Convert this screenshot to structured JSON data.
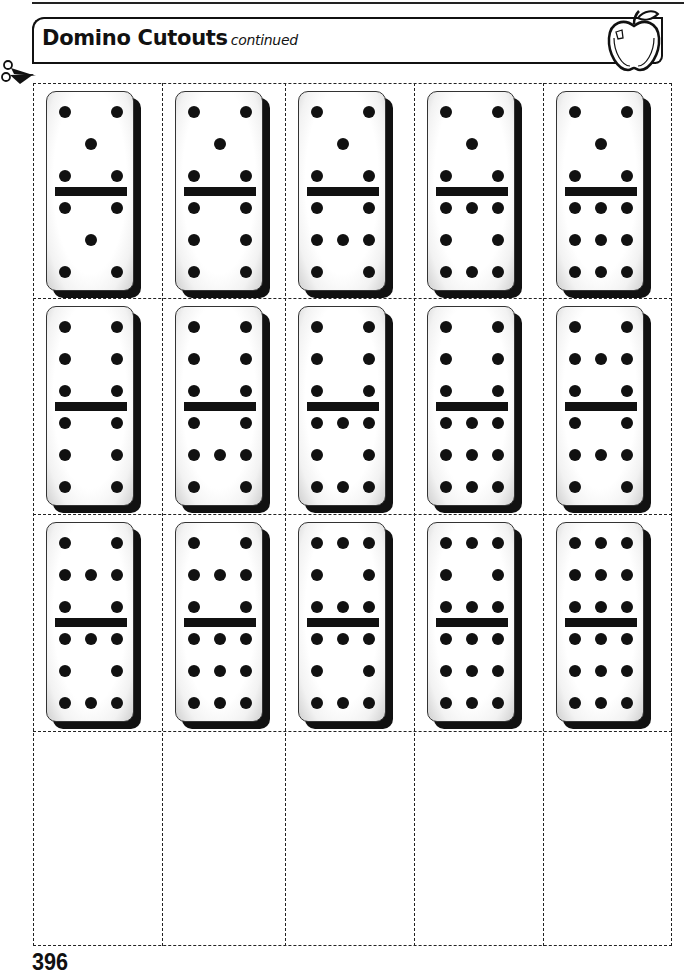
{
  "header": {
    "title": "Domino Cutouts",
    "subtitle": "continued",
    "icon": "apple-icon"
  },
  "cut_guide": {
    "icon": "scissors-icon"
  },
  "grid": {
    "columns": 5,
    "rows": 4,
    "dominoes": [
      {
        "top": 5,
        "bottom": 5
      },
      {
        "top": 5,
        "bottom": 6
      },
      {
        "top": 5,
        "bottom": 7
      },
      {
        "top": 5,
        "bottom": 8
      },
      {
        "top": 5,
        "bottom": 9
      },
      {
        "top": 6,
        "bottom": 6
      },
      {
        "top": 6,
        "bottom": 7
      },
      {
        "top": 6,
        "bottom": 8
      },
      {
        "top": 6,
        "bottom": 9
      },
      {
        "top": 7,
        "bottom": 7
      },
      {
        "top": 7,
        "bottom": 8
      },
      {
        "top": 7,
        "bottom": 9
      },
      {
        "top": 8,
        "bottom": 8
      },
      {
        "top": 8,
        "bottom": 9
      },
      {
        "top": 9,
        "bottom": 9
      }
    ],
    "empty_cells": 5
  },
  "footer": {
    "page_number": "396"
  }
}
